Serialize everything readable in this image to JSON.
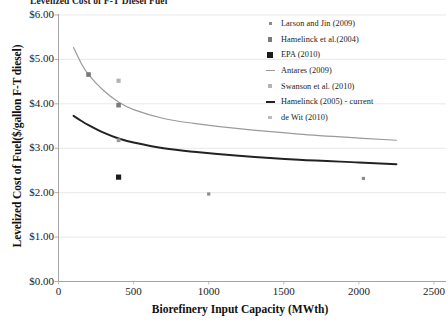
{
  "title": "Levelized Cost of F-T Diesel Fuel",
  "axes": {
    "y_label": "Levelized Cost of Fuel($/gallon F-T diesel)",
    "x_label": "Biorefinery Input Capacity (MWth)",
    "y_ticks": [
      "$6.00",
      "$5.00",
      "$4.00",
      "$3.00",
      "$2.00",
      "$1.00",
      "$0.00"
    ],
    "x_ticks": [
      "0",
      "500",
      "1000",
      "1500",
      "2000",
      "2500"
    ]
  },
  "legend": {
    "items": [
      {
        "label": "Larson and Jin (2009)",
        "key": "small-square-marker",
        "color": "#8c8c8c",
        "type": "marker",
        "size": 3
      },
      {
        "label": "Hamelinck et al.(2004)",
        "key": "square-marker",
        "color": "#7a7a7a",
        "type": "marker",
        "size": 4.6
      },
      {
        "label": "EPA (2010)",
        "key": "filled-square-marker",
        "color": "#1c1c1c",
        "type": "marker",
        "size": 5.2
      },
      {
        "label": "Antares (2009)",
        "key": "line-swatch",
        "color": "#9a9a9a",
        "type": "line",
        "width": 1.3
      },
      {
        "label": "Swanson et al. (2010)",
        "key": "light-square-marker",
        "color": "#b3b3b3",
        "type": "marker",
        "size": 4
      },
      {
        "label": "Hamelinck (2005) - current",
        "key": "line-swatch",
        "color": "#222222",
        "type": "line",
        "width": 2.2
      },
      {
        "label": "de Wit (2010)",
        "key": "pale-square-marker",
        "color": "#bdbdbd",
        "type": "marker",
        "size": 3.6
      }
    ]
  },
  "chart_data": {
    "type": "scatter",
    "title": "Levelized Cost of F-T Diesel Fuel",
    "xlabel": "Biorefinery Input Capacity (MWth)",
    "ylabel": "Levelized Cost of Fuel($/gallon F-T diesel)",
    "xlim": [
      0,
      2500
    ],
    "ylim": [
      0,
      6
    ],
    "grid": "horizontal",
    "legend_position": "right-top",
    "series": [
      {
        "name": "Antares (2009)",
        "type": "line",
        "color": "#9a9a9a",
        "points": [
          {
            "x": 100,
            "y": 5.27
          },
          {
            "x": 150,
            "y": 4.92
          },
          {
            "x": 200,
            "y": 4.66
          },
          {
            "x": 300,
            "y": 4.3
          },
          {
            "x": 400,
            "y": 4.04
          },
          {
            "x": 500,
            "y": 3.87
          },
          {
            "x": 700,
            "y": 3.67
          },
          {
            "x": 900,
            "y": 3.56
          },
          {
            "x": 1200,
            "y": 3.44
          },
          {
            "x": 1600,
            "y": 3.32
          },
          {
            "x": 2000,
            "y": 3.23
          },
          {
            "x": 2250,
            "y": 3.18
          }
        ]
      },
      {
        "name": "Hamelinck (2005) - current",
        "type": "line",
        "color": "#222222",
        "points": [
          {
            "x": 100,
            "y": 3.73
          },
          {
            "x": 150,
            "y": 3.62
          },
          {
            "x": 200,
            "y": 3.52
          },
          {
            "x": 300,
            "y": 3.35
          },
          {
            "x": 400,
            "y": 3.22
          },
          {
            "x": 500,
            "y": 3.13
          },
          {
            "x": 700,
            "y": 3.0
          },
          {
            "x": 900,
            "y": 2.92
          },
          {
            "x": 1200,
            "y": 2.83
          },
          {
            "x": 1600,
            "y": 2.74
          },
          {
            "x": 2000,
            "y": 2.68
          },
          {
            "x": 2250,
            "y": 2.64
          }
        ]
      },
      {
        "name": "Hamelinck et al.(2004)",
        "type": "marker",
        "color": "#7a7a7a",
        "size": 4.6,
        "points": [
          {
            "x": 200,
            "y": 4.66
          },
          {
            "x": 400,
            "y": 3.97
          }
        ]
      },
      {
        "name": "Swanson et al. (2010)",
        "type": "marker",
        "color": "#b3b3b3",
        "size": 4.2,
        "points": [
          {
            "x": 400,
            "y": 4.52
          }
        ]
      },
      {
        "name": "EPA (2010)",
        "type": "marker",
        "color": "#1c1c1c",
        "size": 5.2,
        "points": [
          {
            "x": 400,
            "y": 2.35
          }
        ]
      },
      {
        "name": "Larson and Jin (2009)",
        "type": "marker",
        "color": "#8c8c8c",
        "size": 3.2,
        "points": [
          {
            "x": 1000,
            "y": 1.97
          },
          {
            "x": 2030,
            "y": 2.32
          }
        ]
      },
      {
        "name": "de Wit (2010)",
        "type": "marker",
        "color": "#9b9b9b",
        "size": 3.8,
        "points": [
          {
            "x": 400,
            "y": 3.18
          }
        ]
      }
    ]
  }
}
